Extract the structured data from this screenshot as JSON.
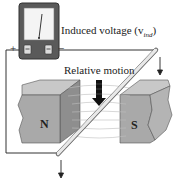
{
  "diagram": {
    "labels": {
      "induced_voltage": "Induced voltage (v",
      "induced_voltage_sub": "ind",
      "induced_voltage_close": ")",
      "relative_motion": "Relative motion",
      "plus_terminal": "+",
      "minus_terminal": "−",
      "north_pole": "N",
      "south_pole": "S"
    },
    "components": [
      {
        "name": "voltmeter",
        "type": "analog meter",
        "terminals": [
          "+",
          "−"
        ]
      },
      {
        "name": "north-magnet",
        "label": "N"
      },
      {
        "name": "south-magnet",
        "label": "S"
      },
      {
        "name": "conductor-rod",
        "motion": "downward"
      },
      {
        "name": "field-lines",
        "direction": "N to S"
      },
      {
        "name": "motion-arrow",
        "direction": "down"
      }
    ],
    "colors": {
      "meter_body": "#5a5a5a",
      "meter_face": "#f4f4f4",
      "magnet_front": "#a9a9a9",
      "magnet_top": "#c8c8c8",
      "magnet_side": "#8e8e8e",
      "wire": "#333333",
      "field_lines": "#bdbdbd"
    }
  }
}
